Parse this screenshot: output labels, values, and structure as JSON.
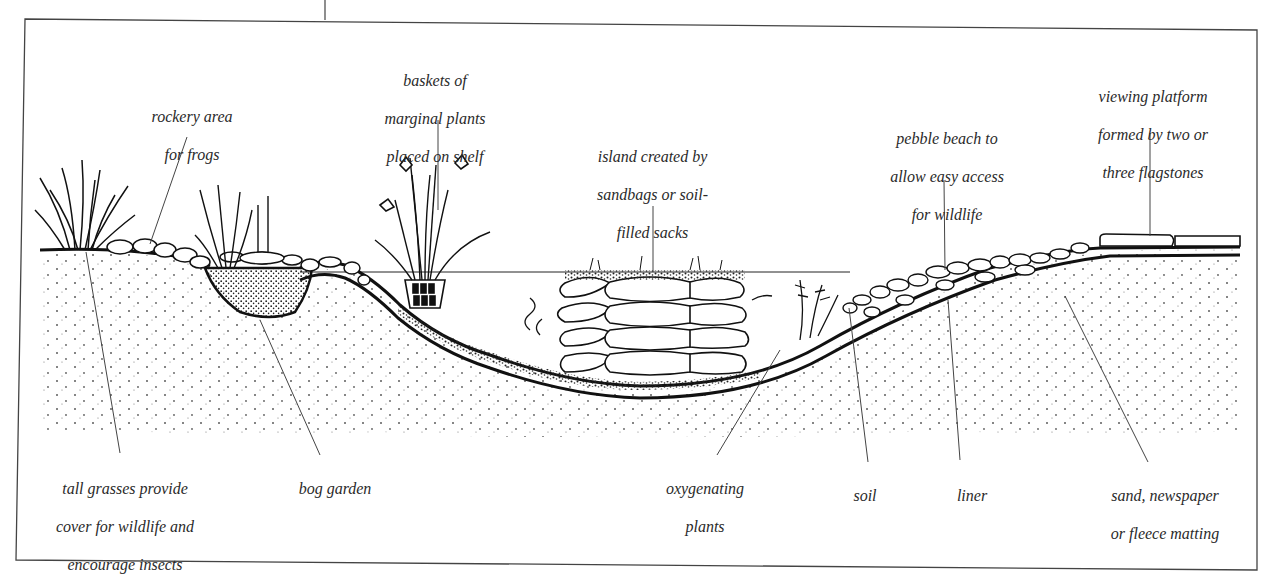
{
  "diagram": {
    "type": "cross-section",
    "colors": {
      "ink": "#1a1a1a",
      "leader_line": "#444444",
      "frame": "#444444",
      "background": "#ffffff"
    },
    "top_labels": [
      {
        "id": "rockery",
        "lines": [
          "rockery area",
          "for frogs"
        ]
      },
      {
        "id": "baskets",
        "lines": [
          "baskets of",
          "marginal plants",
          "placed on shelf"
        ]
      },
      {
        "id": "island",
        "lines": [
          "island created by",
          "sandbags or soil-",
          "filled sacks"
        ]
      },
      {
        "id": "pebble-beach",
        "lines": [
          "pebble beach to",
          "allow easy access",
          "for wildlife"
        ]
      },
      {
        "id": "viewing-platform",
        "lines": [
          "viewing platform",
          "formed by two or",
          "three flagstones"
        ]
      }
    ],
    "bottom_labels": [
      {
        "id": "tall-grasses",
        "lines": [
          "tall grasses provide",
          "cover for wildlife and",
          "encourage insects"
        ]
      },
      {
        "id": "bog-garden",
        "lines": [
          "bog garden"
        ]
      },
      {
        "id": "oxygenating",
        "lines": [
          "oxygenating",
          "plants"
        ]
      },
      {
        "id": "soil",
        "lines": [
          "soil"
        ]
      },
      {
        "id": "liner",
        "lines": [
          "liner"
        ]
      },
      {
        "id": "underlay",
        "lines": [
          "sand, newspaper",
          "or fleece matting"
        ]
      }
    ]
  }
}
